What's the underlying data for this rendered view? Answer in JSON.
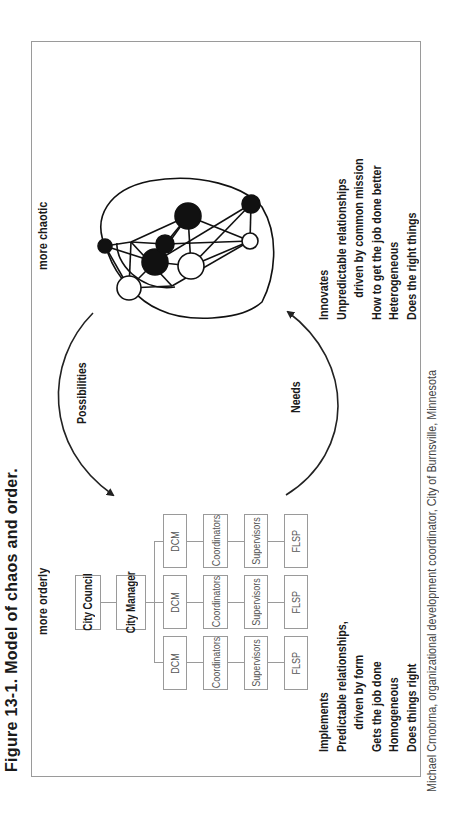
{
  "figure": {
    "title": "Figure 13-1. Model of chaos and order.",
    "orientation": "rotated 90 degrees counterclockwise",
    "credit": "Michael Crnobrna, organizational development coordinator, City of Burnsville, Minnesota"
  },
  "orderly": {
    "heading": "more orderly",
    "org_chart": {
      "top": [
        "City Council",
        "City Manager"
      ],
      "columns": [
        [
          "DCM",
          "Coordinators",
          "Supervisors",
          "FLSP"
        ],
        [
          "DCM",
          "Coordinators",
          "Supervisors",
          "FLSP"
        ],
        [
          "DCM",
          "Coordinators",
          "Supervisors",
          "FLSP"
        ]
      ]
    },
    "traits": [
      "Implements",
      "Predictable relationships,",
      "driven by form",
      "Gets the job done",
      "Homogeneous",
      "Does things right"
    ]
  },
  "chaotic": {
    "heading": "more chaotic",
    "network": {
      "nodes": [
        {
          "id": "a",
          "fill": "white",
          "r": 12
        },
        {
          "id": "b",
          "fill": "black",
          "r": 13
        },
        {
          "id": "c",
          "fill": "white",
          "r": 13
        },
        {
          "id": "d",
          "fill": "white",
          "r": 8
        },
        {
          "id": "e",
          "fill": "black",
          "r": 10
        },
        {
          "id": "f",
          "fill": "black",
          "r": 9
        },
        {
          "id": "g",
          "fill": "black",
          "r": 9
        },
        {
          "id": "h",
          "fill": "white",
          "r": 17
        },
        {
          "id": "i",
          "fill": "black",
          "r": 13
        }
      ]
    },
    "traits": [
      "Innovates",
      "Unpredictable relationships",
      "driven by common mission",
      "How to get the job done better",
      "Heterogeneous",
      "Does the right things"
    ]
  },
  "cycle": {
    "top_arrow_label": "Possibilities",
    "bottom_arrow_label": "Needs"
  }
}
